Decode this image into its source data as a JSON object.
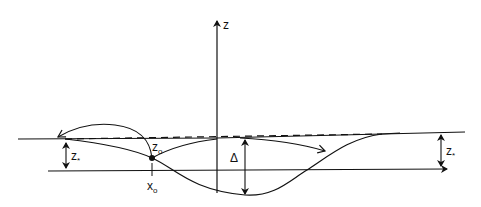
{
  "diagram": {
    "axis_label": "z",
    "labels": {
      "z0": "z",
      "z0_sub": "o",
      "x0": "x",
      "x0_sub": "o",
      "delta": "Δ",
      "zstar_left": "z",
      "zstar_left_sub": "*",
      "zstar_right": "z",
      "zstar_right_sub": "*"
    },
    "colors": {
      "line": "#111111",
      "background": "#ffffff"
    }
  }
}
